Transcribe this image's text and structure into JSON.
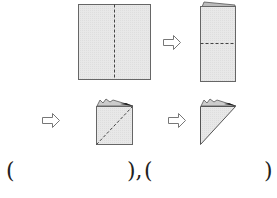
{
  "diagram": {
    "steps": [
      {
        "shape": "square",
        "fold_line": "vertical-dashed"
      },
      {
        "shape": "tall-rectangle",
        "fold_line": "horizontal-dashed"
      },
      {
        "shape": "small-square-layered",
        "fold_line": "diagonal-dashed"
      },
      {
        "shape": "triangle-layered",
        "fold_line": "none"
      }
    ],
    "arrows": [
      "right-arrow",
      "right-arrow",
      "right-arrow"
    ],
    "colors": {
      "paper": "#e6e6e6",
      "edge": "#555555",
      "dash": "#444444"
    }
  },
  "answer": {
    "open1": "(",
    "close1": "),",
    "open2": "(",
    "close2": ")"
  }
}
